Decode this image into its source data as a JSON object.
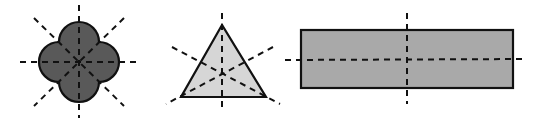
{
  "figure": {
    "colors": {
      "background": "#ffffff",
      "outline": "#111111",
      "axis": "#111111",
      "quatrefoil_fill": "#595959",
      "triangle_fill": "#d6d6d6",
      "rectangle_fill": "#a9a9a9"
    },
    "shapes": [
      {
        "name": "quatrefoil",
        "lines_of_symmetry": 4,
        "center": [
          79,
          62
        ],
        "petal_offset": 20,
        "petal_radius": 20,
        "axes": [
          [
            79,
            5,
            79,
            118
          ],
          [
            20,
            62,
            138,
            62
          ],
          [
            34,
            18,
            124,
            106
          ],
          [
            124,
            18,
            34,
            106
          ]
        ]
      },
      {
        "name": "equilateral-triangle",
        "lines_of_symmetry": 3,
        "vertices": [
          [
            222,
            25
          ],
          [
            181,
            97
          ],
          [
            266,
            97
          ]
        ],
        "axes": [
          [
            222,
            13,
            222,
            112
          ],
          [
            172,
            47,
            280,
            104
          ],
          [
            273,
            47,
            166,
            104
          ]
        ]
      },
      {
        "name": "rectangle",
        "lines_of_symmetry": 2,
        "rect": [
          301,
          30,
          212,
          58
        ],
        "axes": [
          [
            285,
            60,
            526,
            59
          ],
          [
            407,
            13,
            407,
            104
          ]
        ]
      }
    ]
  }
}
